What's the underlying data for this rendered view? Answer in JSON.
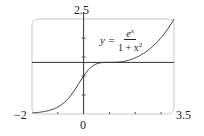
{
  "chart_data": {
    "type": "line",
    "title": "",
    "function": "y = e^x / (1 + x^2)",
    "annotation": {
      "lhs": "y =",
      "numerator": "e",
      "numerator_exp": "x",
      "denominator": "1 + x",
      "denominator_exp": "2"
    },
    "xlim": [
      -2,
      3.5
    ],
    "ylim": [
      0,
      2.5
    ],
    "x_tick_labels": [
      "-2",
      "0",
      "3.5"
    ],
    "y_tick_labels": [
      "2.5"
    ],
    "x_ticks": [
      -1,
      1,
      2,
      3
    ],
    "y_ticks": [
      0.5,
      1,
      1.5,
      2
    ],
    "tangent_line": {
      "y": 1.359,
      "note": "horizontal tangent at x = 1, y = e/2"
    },
    "series": [
      {
        "name": "e^x/(1+x^2)",
        "x": [
          -2,
          -1.5,
          -1,
          -0.5,
          0,
          0.5,
          1,
          1.5,
          2,
          2.5,
          3,
          3.5
        ],
        "values": [
          0.027,
          0.069,
          0.184,
          0.485,
          1.0,
          1.319,
          1.359,
          1.379,
          1.478,
          1.68,
          2.009,
          2.501
        ]
      }
    ],
    "grid": false,
    "legend": null
  },
  "labels": {
    "xmin": "−2",
    "xmax": "3.5",
    "origin": "0",
    "ymax": "2.5"
  }
}
